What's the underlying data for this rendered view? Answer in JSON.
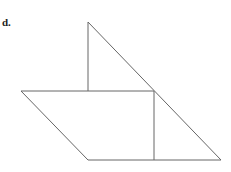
{
  "figure": {
    "label": "d.",
    "stroke_color": "#555555",
    "shapes": [
      {
        "name": "triangle",
        "points": [
          [
            88,
            22
          ],
          [
            88,
            91
          ],
          [
            154,
            91
          ]
        ]
      },
      {
        "name": "parallelogram",
        "points": [
          [
            21,
            91
          ],
          [
            154,
            91
          ],
          [
            154,
            160
          ],
          [
            88,
            160
          ]
        ]
      },
      {
        "name": "right-triangle",
        "points": [
          [
            154,
            91
          ],
          [
            221,
            160
          ],
          [
            154,
            160
          ]
        ]
      }
    ]
  }
}
